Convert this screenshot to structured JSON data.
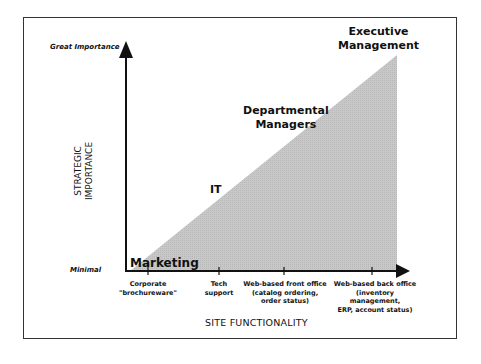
{
  "diagram": {
    "type": "strategic-importance-vs-functionality",
    "y_axis": {
      "title": "STRATEGIC\nIMPORTANCE",
      "title_line1": "STRATEGIC",
      "title_line2": "IMPORTANCE",
      "top_label": "Great Importance",
      "bottom_label": "Minimal"
    },
    "x_axis": {
      "title": "SITE FUNCTIONALITY",
      "ticks": [
        {
          "line1": "Corporate",
          "line2": "\"brochureware\"",
          "line3": ""
        },
        {
          "line1": "Tech",
          "line2": "support",
          "line3": ""
        },
        {
          "line1": "Web-based front office",
          "line2": "(catalog ordering,",
          "line3": "order status)"
        },
        {
          "line1": "Web-based back office",
          "line2": "(inventory management,",
          "line3": "ERP, account status)"
        }
      ]
    },
    "regions": [
      {
        "line1": "Marketing",
        "line2": ""
      },
      {
        "line1": "IT",
        "line2": ""
      },
      {
        "line1": "Departmental",
        "line2": "Managers"
      },
      {
        "line1": "Executive",
        "line2": "Management"
      }
    ],
    "colors": {
      "triangle_fill": "#c4c4c4",
      "axis": "#111111",
      "frame": "#333333"
    }
  }
}
